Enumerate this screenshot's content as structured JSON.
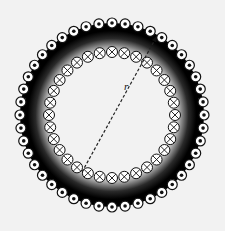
{
  "diagram": {
    "center": [
      112,
      115
    ],
    "outer_ring": {
      "radius": 92,
      "count": 44,
      "symbol": "dot-in-circle",
      "meaning": "current out of page",
      "conductor_radius": 5
    },
    "inner_ring": {
      "radius": 63,
      "count": 32,
      "symbol": "cross-in-circle",
      "meaning": "current into page",
      "conductor_radius": 5.5
    },
    "core_fill": "#000000",
    "background": "#f2f2f2",
    "radius_line": {
      "label": "r",
      "from": [
        82,
        172
      ],
      "to": [
        157,
        36
      ]
    }
  }
}
